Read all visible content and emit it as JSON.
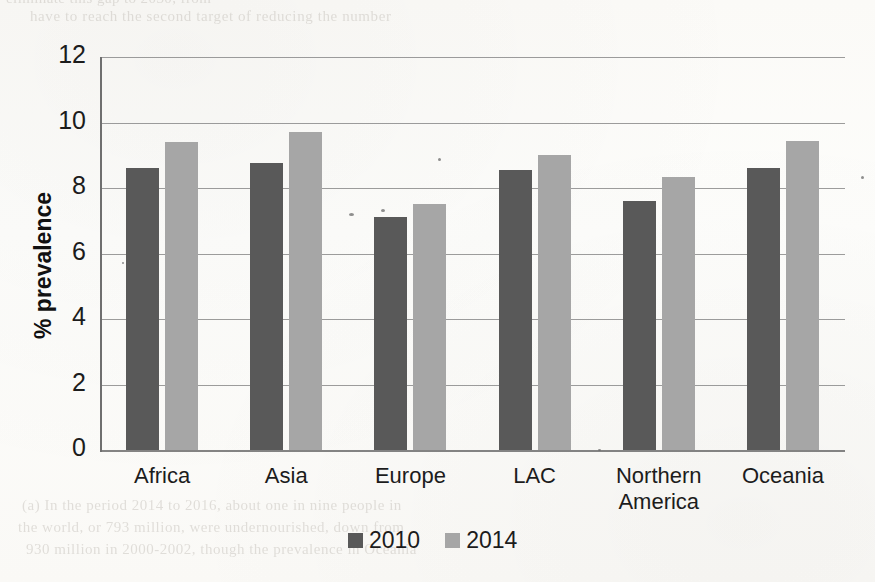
{
  "page": {
    "background_color": "#fdfcfa",
    "bleed_through_text": {
      "line1": "eliminate this gap to 2030, from",
      "line2": "have to reach the second target of reducing the number",
      "line3": "(a) In the period 2014 to 2016, about one in nine people in",
      "line4": "the world, or 793 million, were undernourished, down from",
      "line5": "930 million in 2000-2002, though the prevalence in Oceania"
    }
  },
  "chart_data": {
    "type": "bar",
    "title": "",
    "subtitle": "",
    "xlabel": "",
    "ylabel": "% prevalence",
    "categories": [
      "Africa",
      "Asia",
      "Europe",
      "LAC",
      "Northern America",
      "Oceania"
    ],
    "category_lines": [
      [
        "Africa"
      ],
      [
        "Asia"
      ],
      [
        "Europe"
      ],
      [
        "LAC"
      ],
      [
        "Northern",
        "America"
      ],
      [
        "Oceania"
      ]
    ],
    "series": [
      {
        "name": "2010",
        "color": "#595959",
        "values": [
          8.6,
          8.75,
          7.1,
          8.55,
          7.6,
          8.6
        ]
      },
      {
        "name": "2014",
        "color": "#a6a6a6",
        "values": [
          9.4,
          9.7,
          7.5,
          9.0,
          8.35,
          9.45
        ]
      }
    ],
    "ylim": [
      0,
      12
    ],
    "yticks": [
      0,
      2,
      4,
      6,
      8,
      10,
      12
    ],
    "ytick_labels": [
      "0",
      "2",
      "4",
      "6",
      "8",
      "10",
      "12"
    ],
    "grid": true,
    "grid_axis": "y",
    "legend": {
      "position": "bottom-center",
      "entries": [
        {
          "label": "2010",
          "color": "#595959"
        },
        {
          "label": "2014",
          "color": "#a6a6a6"
        }
      ]
    },
    "axis_color": "#6f6f6f",
    "gridline_color": "#8b8b8b"
  }
}
